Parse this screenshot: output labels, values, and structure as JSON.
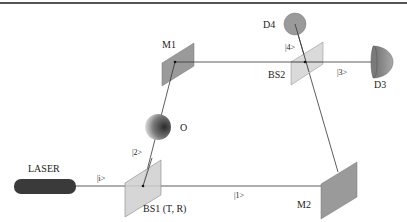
{
  "diagram": {
    "components": {
      "laser": {
        "label": "LASER",
        "color": "#3a3a3a"
      },
      "bs1": {
        "label": "BS1 (T, R)",
        "color": "#cfcfcf"
      },
      "bs2": {
        "label": "BS2",
        "color": "#d4d4d4"
      },
      "m1": {
        "label": "M1",
        "color": "#9a9a9a"
      },
      "m2": {
        "label": "M2",
        "color": "#9a9a9a"
      },
      "object": {
        "label": "O"
      },
      "d3": {
        "label": "D3",
        "color": "#9a9a9a"
      },
      "d4": {
        "label": "D4",
        "color": "#9a9a9a"
      }
    },
    "states": {
      "input": "|i>",
      "path1": "|1>",
      "path2": "|2>",
      "out3": "|3>",
      "out4": "|4>"
    },
    "colors": {
      "beam": "#333333",
      "rule": "#555555"
    }
  }
}
